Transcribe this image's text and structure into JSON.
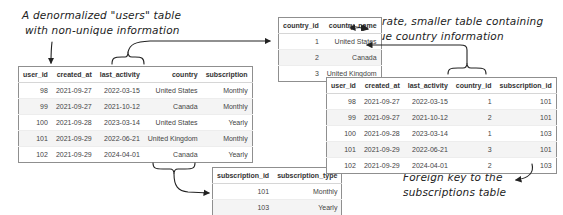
{
  "annotations": {
    "users_note_line1": "A denormalized \"users\" table",
    "users_note_line2": "with non-unique information",
    "country_note_line1": "Separate, smaller table containing",
    "country_note_line2": "unique country information",
    "fk_note_line1": "Foreign key to the",
    "fk_note_line2": "subscriptions table"
  },
  "denormalized_users_table": {
    "columns": [
      "user_id",
      "created_at",
      "last_activity",
      "country",
      "subscription"
    ],
    "rows": [
      [
        "98",
        "2021-09-27",
        "2022-03-15",
        "United States",
        "Monthly"
      ],
      [
        "99",
        "2021-09-27",
        "2021-10-12",
        "Canada",
        "Monthly"
      ],
      [
        "100",
        "2021-09-28",
        "2023-03-14",
        "United States",
        "Yearly"
      ],
      [
        "101",
        "2021-09-29",
        "2022-06-21",
        "United Kingdom",
        "Monthly"
      ],
      [
        "102",
        "2021-09-29",
        "2024-04-01",
        "Canada",
        "Yearly"
      ]
    ]
  },
  "countries_table": {
    "columns": [
      "country_id",
      "country_name"
    ],
    "rows": [
      [
        "1",
        "United States"
      ],
      [
        "2",
        "Canada"
      ],
      [
        "3",
        "United Kingdom"
      ]
    ]
  },
  "subscriptions_table": {
    "columns": [
      "subscription_id",
      "subscription_type"
    ],
    "rows": [
      [
        "101",
        "Monthly"
      ],
      [
        "103",
        "Yearly"
      ]
    ]
  },
  "normalized_users_table": {
    "columns": [
      "user_id",
      "created_at",
      "last_activity",
      "country_id",
      "subscription_id"
    ],
    "rows": [
      [
        "98",
        "2021-09-27",
        "2022-03-15",
        "1",
        "101"
      ],
      [
        "99",
        "2021-09-27",
        "2021-10-12",
        "2",
        "101"
      ],
      [
        "100",
        "2021-09-28",
        "2023-03-14",
        "1",
        "103"
      ],
      [
        "101",
        "2021-09-29",
        "2022-06-21",
        "3",
        "101"
      ],
      [
        "102",
        "2021-09-29",
        "2024-04-01",
        "2",
        "103"
      ]
    ]
  }
}
